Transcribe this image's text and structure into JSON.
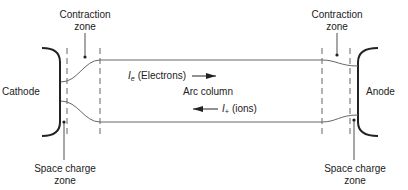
{
  "diagram": {
    "electrodes": {
      "cathode": "Cathode",
      "anode": "Anode"
    },
    "zones": {
      "contraction_left": [
        "Contraction",
        "zone"
      ],
      "contraction_right": [
        "Contraction",
        "zone"
      ],
      "space_charge_left": [
        "Space charge",
        "zone"
      ],
      "space_charge_right": [
        "Space charge",
        "zone"
      ]
    },
    "column": {
      "label": "Arc column",
      "electron_current": {
        "symbol": "I",
        "subscript": "e",
        "text": "(Electrons)",
        "direction": "right"
      },
      "ion_current": {
        "symbol": "I",
        "subscript": "+",
        "text": "(ions)",
        "direction": "left"
      }
    },
    "colors": {
      "line": "#555555",
      "bracket": "#222222",
      "text": "#222222"
    }
  }
}
